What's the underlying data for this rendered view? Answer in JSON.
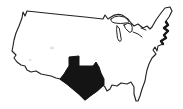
{
  "image": {
    "description": "Hand-drawn outline map of the contiguous United States with one state filled solid black",
    "country": "United States",
    "highlighted_region": "Texas",
    "lakes": [
      "Lake Superior",
      "Lake Michigan",
      "Lake Huron",
      "Lake Erie",
      "Lake Ontario"
    ],
    "colors": {
      "background": "#ffffff",
      "outline": "#222222",
      "texas_fill": "#141414"
    }
  }
}
